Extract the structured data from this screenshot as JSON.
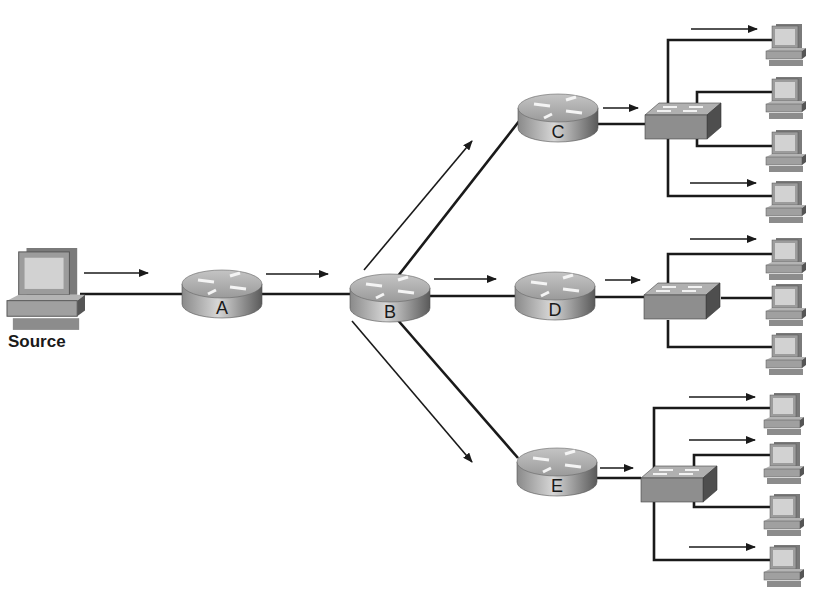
{
  "diagram": {
    "type": "network-multicast-topology",
    "colors": {
      "line": "#1a1a1a",
      "router_body": "#9a9a9a",
      "router_top": "#b8b8b8",
      "switch_body": "#8c8c8c",
      "switch_top": "#a8a8a8",
      "monitor": "#d0d0d0",
      "pc_body": "#9e9e9e"
    },
    "source": {
      "label": "Source"
    },
    "routers": [
      {
        "id": "A",
        "label": "A"
      },
      {
        "id": "B",
        "label": "B"
      },
      {
        "id": "C",
        "label": "C"
      },
      {
        "id": "D",
        "label": "D"
      },
      {
        "id": "E",
        "label": "E"
      }
    ],
    "switches": [
      {
        "id": "switch-c",
        "parent": "C",
        "hosts": 4,
        "hosts_receiving": [
          1,
          4
        ]
      },
      {
        "id": "switch-d",
        "parent": "D",
        "hosts": 3,
        "hosts_receiving": [
          1
        ]
      },
      {
        "id": "switch-e",
        "parent": "E",
        "hosts": 4,
        "hosts_receiving": [
          1,
          2,
          4
        ]
      }
    ],
    "links": [
      [
        "Source",
        "A"
      ],
      [
        "A",
        "B"
      ],
      [
        "B",
        "C"
      ],
      [
        "B",
        "D"
      ],
      [
        "B",
        "E"
      ],
      [
        "C",
        "switch-c"
      ],
      [
        "D",
        "switch-d"
      ],
      [
        "E",
        "switch-e"
      ]
    ]
  }
}
